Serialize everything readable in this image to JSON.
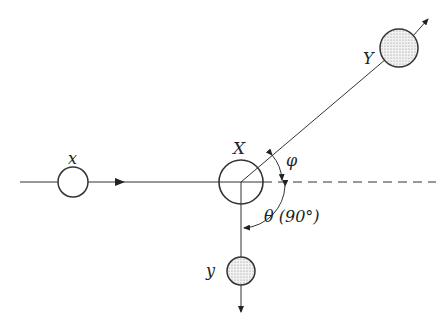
{
  "diagram": {
    "labels": {
      "incident": "x",
      "target": "X",
      "heavy_product": "Y",
      "light_product": "y",
      "phi": "φ",
      "theta": "θ (90°)"
    },
    "colors": {
      "line": "#333333",
      "stipple": "#9a9a9a",
      "background": "#ffffff"
    }
  }
}
